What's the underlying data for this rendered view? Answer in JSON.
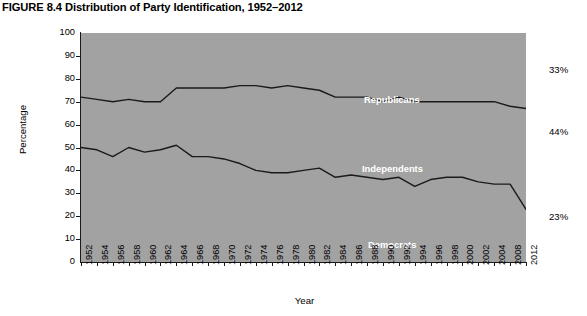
{
  "caption": {
    "figure_number": "FIGURE 8.4",
    "title": "Distribution of Party Identification, 1952–2012"
  },
  "axes": {
    "y_title": "Percentage",
    "x_title": "Year",
    "y_ticks": [
      "0",
      "10",
      "20",
      "30",
      "40",
      "50",
      "60",
      "70",
      "80",
      "90",
      "100"
    ],
    "x_ticks": [
      "1952",
      "1954",
      "1956",
      "1958",
      "1960",
      "1962",
      "1964",
      "1966",
      "1968",
      "1970",
      "1972",
      "1974",
      "1976",
      "1978",
      "1980",
      "1982",
      "1984",
      "1986",
      "1988",
      "1990",
      "1992",
      "1994",
      "1996",
      "1998",
      "2000",
      "2002",
      "2004",
      "2008",
      "2012"
    ]
  },
  "series_labels": {
    "republicans": "Republicans",
    "independents": "Independents",
    "democrats": "Democrats"
  },
  "end_values": {
    "republicans": "33%",
    "independents": "44%",
    "democrats": "23%"
  },
  "colors": {
    "plot_background": "#a2a2a2",
    "line": "#1a1a1a",
    "label_text": "#ffffff",
    "axis_text": "#000000",
    "page_background": "#ffffff"
  },
  "chart_data": {
    "type": "area",
    "title": "Distribution of Party Identification, 1952–2012",
    "subtitle": "",
    "xlabel": "Year",
    "ylabel": "Percentage",
    "ylim": [
      0,
      100
    ],
    "grid": false,
    "legend_position": "in-plot-annotations",
    "stacked": true,
    "note": "Stacked 100% area chart. Two boundary lines are drawn: the lower line is the top of the Democrats band, the upper line is the top of the Independents band (Republicans fill the remainder up to 100).",
    "categories": [
      "1952",
      "1954",
      "1956",
      "1958",
      "1960",
      "1962",
      "1964",
      "1966",
      "1968",
      "1970",
      "1972",
      "1974",
      "1976",
      "1978",
      "1980",
      "1982",
      "1984",
      "1986",
      "1988",
      "1990",
      "1992",
      "1994",
      "1996",
      "1998",
      "2000",
      "2002",
      "2004",
      "2008",
      "2012"
    ],
    "series": [
      {
        "name": "Democrats",
        "end_label": "23%",
        "values": [
          50,
          49,
          46,
          50,
          48,
          49,
          51,
          46,
          46,
          45,
          43,
          40,
          39,
          39,
          40,
          41,
          37,
          38,
          37,
          36,
          37,
          33,
          36,
          37,
          37,
          35,
          34,
          34,
          23
        ]
      },
      {
        "name": "Independents",
        "end_label": "44%",
        "values": [
          22,
          22,
          24,
          21,
          22,
          21,
          25,
          30,
          30,
          31,
          34,
          37,
          37,
          38,
          36,
          34,
          35,
          34,
          35,
          34,
          35,
          37,
          34,
          33,
          33,
          35,
          36,
          34,
          44
        ]
      },
      {
        "name": "Republicans",
        "end_label": "33%",
        "values": [
          28,
          29,
          30,
          29,
          30,
          30,
          24,
          24,
          24,
          24,
          23,
          23,
          24,
          23,
          24,
          25,
          28,
          28,
          28,
          30,
          28,
          30,
          30,
          30,
          30,
          30,
          30,
          32,
          33
        ]
      }
    ],
    "boundary_lines": {
      "democrats_top": [
        50,
        49,
        46,
        50,
        48,
        49,
        51,
        46,
        46,
        45,
        43,
        40,
        39,
        39,
        40,
        41,
        37,
        38,
        37,
        36,
        37,
        33,
        36,
        37,
        37,
        35,
        34,
        34,
        23
      ],
      "independents_top": [
        72,
        71,
        70,
        71,
        70,
        70,
        76,
        76,
        76,
        76,
        77,
        77,
        76,
        77,
        76,
        75,
        72,
        72,
        72,
        70,
        72,
        70,
        70,
        70,
        70,
        70,
        70,
        68,
        67
      ]
    }
  }
}
